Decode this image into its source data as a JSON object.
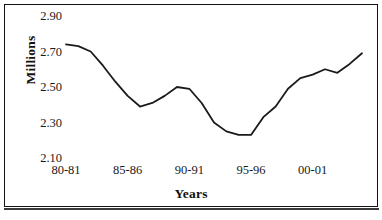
{
  "chart_data": {
    "type": "line",
    "title": "",
    "xlabel": "Years",
    "ylabel": "Millions",
    "grid": false,
    "legend": false,
    "ylim": [
      2.1,
      2.9
    ],
    "ytick_values": [
      2.9,
      2.7,
      2.5,
      2.3,
      2.1
    ],
    "ytick_labels": [
      "2.90",
      "2.70",
      "2.50",
      "2.30",
      "2.10"
    ],
    "xtick_labels": [
      "80-81",
      "85-86",
      "90-91",
      "95-96",
      "00-01"
    ],
    "xtick_positions": [
      0,
      5,
      10,
      15,
      20
    ],
    "line_color": "#1a1a1a",
    "series": [
      {
        "name": "Millions",
        "x": [
          "80-81",
          "81-82",
          "82-83",
          "83-84",
          "84-85",
          "85-86",
          "86-87",
          "87-88",
          "88-89",
          "89-90",
          "90-91",
          "91-92",
          "92-93",
          "93-94",
          "94-95",
          "95-96",
          "96-97",
          "97-98",
          "98-99",
          "99-00",
          "00-01",
          "01-02",
          "02-03",
          "03-04",
          "04-05"
        ],
        "values": [
          2.74,
          2.73,
          2.7,
          2.62,
          2.53,
          2.45,
          2.39,
          2.41,
          2.45,
          2.5,
          2.49,
          2.41,
          2.3,
          2.25,
          2.23,
          2.23,
          2.33,
          2.39,
          2.49,
          2.55,
          2.57,
          2.6,
          2.58,
          2.63,
          2.69
        ]
      }
    ]
  },
  "axes": {
    "y_title": "Millions",
    "x_title": "Years"
  }
}
